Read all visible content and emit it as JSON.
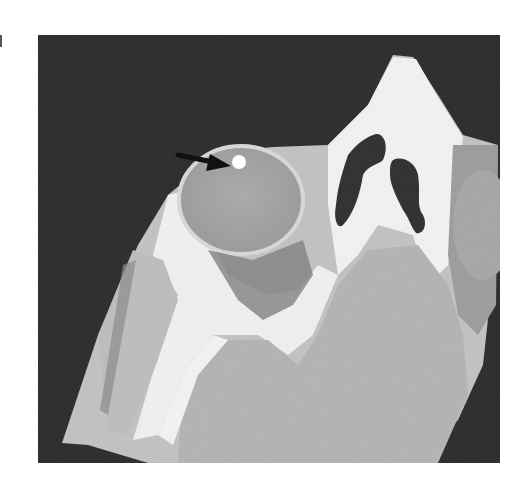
{
  "figure": {
    "annotation": {
      "type": "arrow",
      "points_to": "foreign-body",
      "color": "#111111"
    },
    "colors": {
      "background": "#2a2a2a",
      "bone": "#f4f4f4",
      "soft_tissue": "#b9b9b9",
      "globe": "#a9a9a9",
      "fat": "#7a7a7a",
      "air": "#333333",
      "foreign_body": "#ffffff"
    }
  }
}
